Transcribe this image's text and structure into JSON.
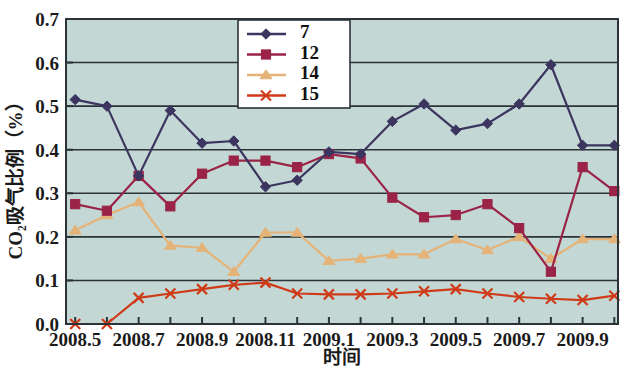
{
  "chart_data": {
    "type": "line",
    "title": "",
    "xlabel": "时间",
    "ylabel": "CO₂吸气比例（%）",
    "ylim": [
      0.0,
      0.7
    ],
    "ytick_labels": [
      "0.0",
      "0.1",
      "0.2",
      "0.3",
      "0.4",
      "0.5",
      "0.6",
      "0.7"
    ],
    "ytick_values": [
      0.0,
      0.1,
      0.2,
      0.3,
      0.4,
      0.5,
      0.6,
      0.7
    ],
    "xtick_labels": [
      "2008.5",
      "2008.7",
      "2008.9",
      "2008.11",
      "2009.1",
      "2009.3",
      "2009.5",
      "2009.7",
      "2009.9"
    ],
    "x_index": [
      0,
      2,
      4,
      6,
      8,
      10,
      12,
      14,
      16
    ],
    "x": [
      "2008.5",
      "2008.6",
      "2008.7",
      "2008.8",
      "2008.9",
      "2008.10",
      "2008.11",
      "2008.12",
      "2009.1",
      "2009.2",
      "2009.3",
      "2009.4",
      "2009.5",
      "2009.6",
      "2009.7",
      "2009.8",
      "2009.9",
      "2009.10"
    ],
    "grid": true,
    "legend_position": "top-center",
    "plot_background": "#c3d8d4",
    "series": [
      {
        "name": "7",
        "color": "#3b3560",
        "marker": "diamond",
        "values": [
          0.515,
          0.5,
          0.34,
          0.49,
          0.415,
          0.42,
          0.315,
          0.33,
          0.395,
          0.39,
          0.465,
          0.505,
          0.445,
          0.46,
          0.505,
          0.595,
          0.41,
          0.41
        ]
      },
      {
        "name": "12",
        "color": "#9a2347",
        "marker": "square",
        "values": [
          0.275,
          0.26,
          0.34,
          0.27,
          0.345,
          0.375,
          0.375,
          0.36,
          0.39,
          0.38,
          0.29,
          0.245,
          0.25,
          0.275,
          0.22,
          0.12,
          0.36,
          0.305
        ]
      },
      {
        "name": "14",
        "color": "#e5b377",
        "marker": "triangle",
        "values": [
          0.215,
          0.25,
          0.28,
          0.18,
          0.175,
          0.12,
          0.21,
          0.21,
          0.145,
          0.15,
          0.16,
          0.16,
          0.195,
          0.17,
          0.2,
          0.15,
          0.195,
          0.195
        ]
      },
      {
        "name": "15",
        "color": "#cf3a18",
        "marker": "cross",
        "values": [
          0.0,
          0.0,
          0.06,
          0.07,
          0.08,
          0.09,
          0.095,
          0.07,
          0.068,
          0.068,
          0.07,
          0.075,
          0.08,
          0.07,
          0.062,
          0.058,
          0.055,
          0.065
        ]
      }
    ]
  },
  "legend": {
    "entries": [
      {
        "label": "7"
      },
      {
        "label": "12"
      },
      {
        "label": "14"
      },
      {
        "label": "15"
      }
    ]
  },
  "colors": {
    "plot_bg": "#c3d8d4",
    "page_bg": "#ffffff",
    "axis": "#2c3338",
    "grid": "#2c3338",
    "series_7": "#3b3560",
    "series_12": "#9a2347",
    "series_14": "#e5b377",
    "series_15": "#cf3a18"
  }
}
